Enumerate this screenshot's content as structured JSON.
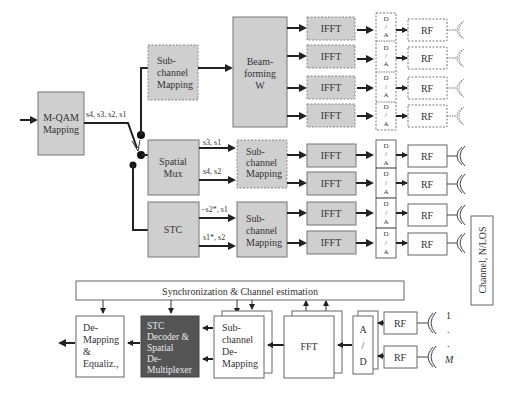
{
  "transmitter": {
    "input": {
      "label_line1": "M-QAM",
      "label_line2": "Mapping"
    },
    "symbols_out": "s4, s3, s2, s1",
    "beamforming_branch": {
      "subchannel_mapping": {
        "line1": "Sub-",
        "line2": "channel",
        "line3": "Mapping"
      },
      "beamforming": {
        "line1": "Beam-",
        "line2": "forming",
        "line3": "W"
      },
      "ifft_label": "IFFT",
      "da_line1": "D",
      "da_line2": "/",
      "da_line3": "A",
      "rf_label": "RF"
    },
    "spatial_mux_branch": {
      "block": {
        "line1": "Spatial",
        "line2": "Mux"
      },
      "stream1": "s3, s1",
      "stream2": "s4, s2",
      "subchannel_mapping": {
        "line1": "Sub-",
        "line2": "channel",
        "line3": "Mapping"
      },
      "ifft_label": "IFFT",
      "rf_label": "RF"
    },
    "stc_branch": {
      "block": {
        "line1": "STC"
      },
      "stream1": "−s2*, s1",
      "stream2": "s1*, s2",
      "subchannel_mapping": {
        "line1": "Sub-",
        "line2": "channel",
        "line3": "Mapping"
      },
      "ifft_label": "IFFT",
      "rf_label": "RF"
    }
  },
  "channel": {
    "label": "Channel, N/LOS"
  },
  "receiver": {
    "sync": {
      "label": "Synchronization & Channel estimation"
    },
    "demapping": {
      "line1": "De-",
      "line2": "Mapping",
      "line3": "&",
      "line4": "Equaliz.,"
    },
    "stc_decoder": {
      "line1": "STC",
      "line2": "Decoder &",
      "line3": "Spatial",
      "line4": "De-",
      "line5": "Multiplexer"
    },
    "subchannel_demapping": {
      "line1": "Sub-",
      "line2": "channel",
      "line3": "De-",
      "line4": "Mapping"
    },
    "fft": {
      "label": "FFT"
    },
    "ad": {
      "line1": "A",
      "line2": "/",
      "line3": "D"
    },
    "rf_label": "RF",
    "antenna_index_first": "1",
    "antenna_dots": ".",
    "antenna_index_last": "M"
  },
  "colors": {
    "gray_block": "#cfcfcf",
    "dark_block": "#555555",
    "line": "#222222"
  }
}
